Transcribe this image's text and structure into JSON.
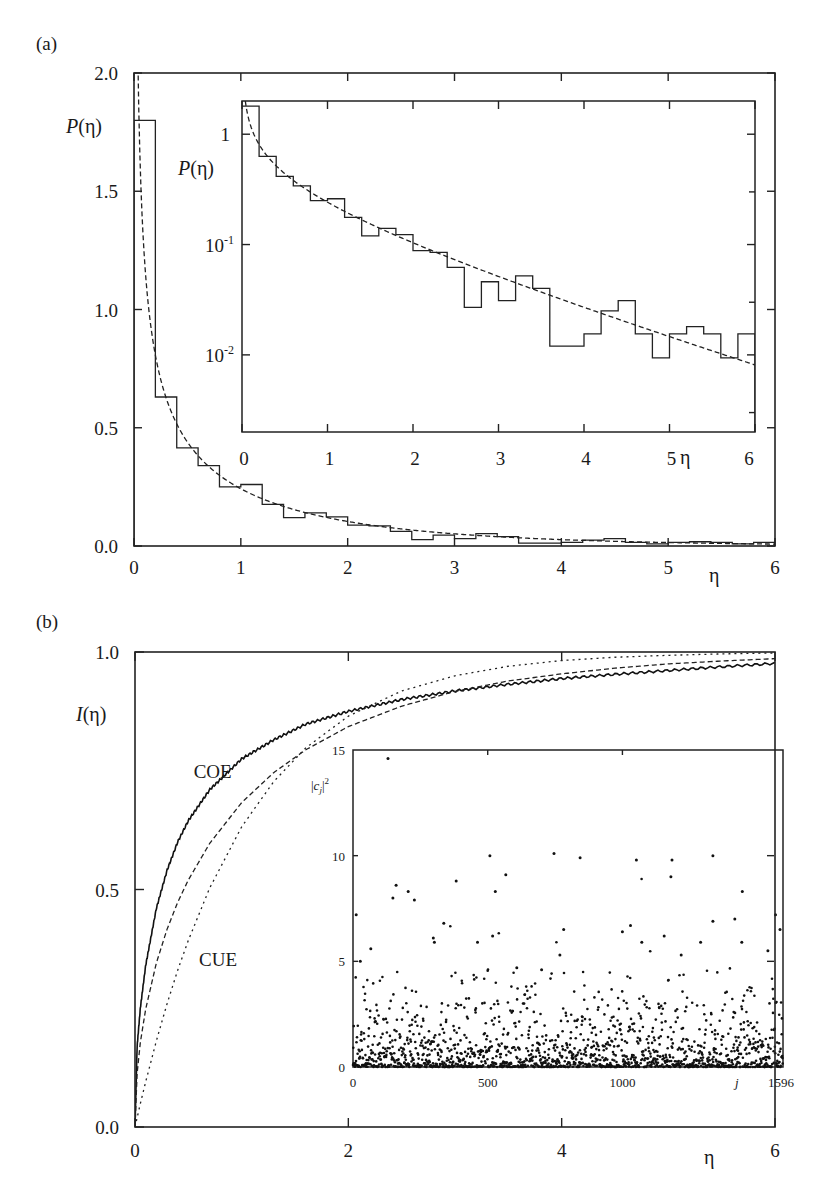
{
  "chart_data": [
    {
      "id": "panel-a",
      "panel_label": "(a)",
      "type": "line",
      "title": "",
      "xlabel": "η",
      "ylabel": "P(η)",
      "xlim": [
        0,
        6
      ],
      "ylim": [
        0,
        2.0
      ],
      "xticks": [
        0,
        1,
        2,
        3,
        4,
        5,
        6
      ],
      "xtick_labels": [
        "0",
        "1",
        "2",
        "3",
        "4",
        "5",
        "6"
      ],
      "yticks": [
        0.0,
        0.5,
        1.0,
        1.5,
        2.0
      ],
      "ytick_labels": [
        "0.0",
        "0.5",
        "1.0",
        "1.5",
        "2.0"
      ],
      "grid": false,
      "series": [
        {
          "name": "histogram",
          "style": "step",
          "bin_width": 0.2,
          "bin_starts": [
            0.0,
            0.2,
            0.4,
            0.6,
            0.8,
            1.0,
            1.2,
            1.4,
            1.6,
            1.8,
            2.0,
            2.2,
            2.4,
            2.6,
            2.8,
            3.0,
            3.2,
            3.4,
            3.6,
            3.8,
            4.0,
            4.2,
            4.4,
            4.6,
            4.8,
            5.0,
            5.2,
            5.4,
            5.6,
            5.8
          ],
          "values": [
            1.8,
            0.63,
            0.415,
            0.34,
            0.25,
            0.26,
            0.176,
            0.12,
            0.14,
            0.123,
            0.088,
            0.085,
            0.062,
            0.027,
            0.046,
            0.031,
            0.052,
            0.04,
            0.012,
            0.012,
            0.0155,
            0.025,
            0.031,
            0.0155,
            0.0094,
            0.0155,
            0.018,
            0.0155,
            0.0094,
            0.0155
          ]
        },
        {
          "name": "Porter-Thomas (COE) P(η) = exp(-η/2)/sqrt(2πη)",
          "style": "dashed",
          "x": [
            0.02,
            0.05,
            0.1,
            0.2,
            0.3,
            0.4,
            0.6,
            0.8,
            1.0,
            1.5,
            2.0,
            2.5,
            3.0,
            3.5,
            4.0,
            4.5,
            5.0,
            5.5,
            6.0
          ],
          "y": [
            2.78,
            1.75,
            1.2,
            0.81,
            0.64,
            0.52,
            0.38,
            0.3,
            0.242,
            0.153,
            0.104,
            0.072,
            0.051,
            0.037,
            0.027,
            0.02,
            0.0146,
            0.0109,
            0.0081
          ]
        }
      ],
      "inset": {
        "type": "line",
        "xlabel": "η",
        "ylabel": "P(η)",
        "yscale": "log",
        "xlim": [
          0,
          6
        ],
        "ylim": [
          0.002,
          2.0
        ],
        "xticks": [
          0,
          1,
          2,
          3,
          4,
          5,
          6
        ],
        "xtick_labels": [
          "0",
          "1",
          "2",
          "3",
          "4",
          "5",
          "6"
        ],
        "yticks": [
          1,
          0.1,
          0.01
        ],
        "ytick_labels": [
          {
            "base": "1",
            "exp": ""
          },
          {
            "base": "10",
            "exp": "-1"
          },
          {
            "base": "10",
            "exp": "-2"
          }
        ],
        "series_ref": "same histogram and Porter-Thomas curve on log scale"
      }
    },
    {
      "id": "panel-b",
      "panel_label": "(b)",
      "type": "line",
      "title": "",
      "xlabel": "η",
      "ylabel": "I(η)",
      "xlim": [
        0,
        6
      ],
      "ylim": [
        0,
        1.0
      ],
      "xticks": [
        0,
        2,
        4,
        6
      ],
      "xtick_labels": [
        "0",
        "2",
        "4",
        "6"
      ],
      "yticks": [
        0.0,
        0.5,
        1.0
      ],
      "ytick_labels": [
        "0.0",
        "0.5",
        "1.0"
      ],
      "grid": false,
      "annotations": [
        {
          "text": "COE",
          "x": 0.55,
          "y": 0.735
        },
        {
          "text": "CUE",
          "x": 0.6,
          "y": 0.34
        }
      ],
      "series": [
        {
          "name": "numerical I(η)",
          "style": "solid",
          "x": [
            0,
            0.02,
            0.05,
            0.1,
            0.2,
            0.3,
            0.4,
            0.5,
            0.7,
            1.0,
            1.3,
            1.6,
            2.0,
            2.5,
            3.0,
            3.5,
            4.0,
            4.5,
            5.0,
            5.5,
            6.0
          ],
          "y": [
            0,
            0.17,
            0.25,
            0.34,
            0.46,
            0.54,
            0.6,
            0.645,
            0.71,
            0.775,
            0.815,
            0.848,
            0.875,
            0.9,
            0.918,
            0.932,
            0.944,
            0.953,
            0.961,
            0.969,
            0.976
          ]
        },
        {
          "name": "COE I(η) = erf(sqrt(η/2))",
          "style": "dashed",
          "x": [
            0,
            0.02,
            0.05,
            0.1,
            0.2,
            0.3,
            0.4,
            0.5,
            0.7,
            1.0,
            1.3,
            1.6,
            2.0,
            2.5,
            3.0,
            3.5,
            4.0,
            4.5,
            5.0,
            5.5,
            6.0
          ],
          "y": [
            0,
            0.113,
            0.178,
            0.248,
            0.345,
            0.416,
            0.473,
            0.52,
            0.597,
            0.683,
            0.746,
            0.794,
            0.843,
            0.886,
            0.917,
            0.939,
            0.954,
            0.966,
            0.975,
            0.981,
            0.986
          ]
        },
        {
          "name": "CUE I(η) = 1 - exp(-η)",
          "style": "dotted",
          "x": [
            0,
            0.05,
            0.1,
            0.2,
            0.3,
            0.4,
            0.5,
            0.7,
            1.0,
            1.3,
            1.6,
            2.0,
            2.5,
            3.0,
            3.5,
            4.0,
            4.5,
            5.0,
            5.5,
            6.0
          ],
          "y": [
            0,
            0.049,
            0.095,
            0.181,
            0.259,
            0.33,
            0.393,
            0.503,
            0.632,
            0.727,
            0.798,
            0.865,
            0.918,
            0.95,
            0.97,
            0.982,
            0.989,
            0.993,
            0.996,
            0.998
          ]
        }
      ],
      "inset": {
        "type": "scatter",
        "xlabel": "j",
        "ylabel": "|c_j|²",
        "xlim": [
          0,
          1596
        ],
        "ylim": [
          0,
          15
        ],
        "xticks": [
          0,
          500,
          1000,
          1596
        ],
        "xtick_labels": [
          "0",
          "500",
          "1000",
          "1596"
        ],
        "yticks": [
          0,
          5,
          10,
          15
        ],
        "ytick_labels": [
          "0",
          "5",
          "10",
          "15"
        ],
        "n_points": 1596,
        "bulk_distribution": "Porter-Thomas (chi-squared, 1 dof), mean 1",
        "notable_points": [
          {
            "j": 130,
            "v": 14.6
          },
          {
            "j": 508,
            "v": 10.0
          },
          {
            "j": 746,
            "v": 10.1
          },
          {
            "j": 843,
            "v": 9.9
          },
          {
            "j": 1336,
            "v": 10.0
          },
          {
            "j": 1184,
            "v": 9.8
          },
          {
            "j": 1180,
            "v": 9.0
          },
          {
            "j": 1052,
            "v": 9.8
          },
          {
            "j": 160,
            "v": 8.6
          },
          {
            "j": 148,
            "v": 8.0
          },
          {
            "j": 205,
            "v": 8.3
          },
          {
            "j": 228,
            "v": 7.9
          },
          {
            "j": 383,
            "v": 8.8
          },
          {
            "j": 528,
            "v": 8.3
          },
          {
            "j": 567,
            "v": 9.1
          },
          {
            "j": 1445,
            "v": 8.3
          },
          {
            "j": 12,
            "v": 7.2
          },
          {
            "j": 337,
            "v": 6.8
          },
          {
            "j": 298,
            "v": 6.1
          },
          {
            "j": 302,
            "v": 5.9
          },
          {
            "j": 462,
            "v": 5.9
          },
          {
            "j": 518,
            "v": 6.2
          },
          {
            "j": 782,
            "v": 6.5
          },
          {
            "j": 1000,
            "v": 6.4
          },
          {
            "j": 1030,
            "v": 6.7
          },
          {
            "j": 1072,
            "v": 5.9
          },
          {
            "j": 1155,
            "v": 6.2
          },
          {
            "j": 1336,
            "v": 6.9
          },
          {
            "j": 1417,
            "v": 7.0
          },
          {
            "j": 1568,
            "v": 7.2
          },
          {
            "j": 1585,
            "v": 6.5
          },
          {
            "j": 66,
            "v": 5.6
          },
          {
            "j": 27,
            "v": 5.0
          },
          {
            "j": 1540,
            "v": 5.5
          },
          {
            "j": 1443,
            "v": 5.9
          },
          {
            "j": 1290,
            "v": 5.9
          },
          {
            "j": 1218,
            "v": 5.3
          },
          {
            "j": 768,
            "v": 5.3
          },
          {
            "j": 608,
            "v": 4.7
          },
          {
            "j": 700,
            "v": 4.6
          }
        ]
      }
    }
  ]
}
